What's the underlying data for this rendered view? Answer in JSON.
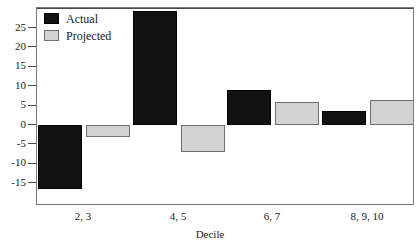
{
  "chart_data": {
    "type": "bar",
    "title": "",
    "xlabel": "Decile",
    "ylabel": "",
    "categories": [
      "2, 3",
      "4, 5",
      "6, 7",
      "8, 9, 10"
    ],
    "series": [
      {
        "name": "Actual",
        "color": "#111111",
        "values": [
          -16.5,
          29.5,
          9,
          3.5
        ]
      },
      {
        "name": "Projected",
        "color": "#d2d2d2",
        "values": [
          -3,
          -7,
          6,
          6.5
        ]
      }
    ],
    "ylim": [
      -18,
      29.5
    ],
    "yticks": [
      25,
      20,
      15,
      10,
      5,
      0,
      -5,
      -10,
      -15
    ],
    "ytick_labels": [
      "25",
      "20",
      "15",
      "10",
      "5",
      "0",
      "-5",
      "-10",
      "-15"
    ],
    "grid": false,
    "legend_position": "top-left"
  },
  "legend": {
    "items": [
      {
        "label": "Actual",
        "swatch": "actual"
      },
      {
        "label": "Projected",
        "swatch": "projected"
      }
    ]
  },
  "axes": {
    "x_title": "Decile"
  }
}
